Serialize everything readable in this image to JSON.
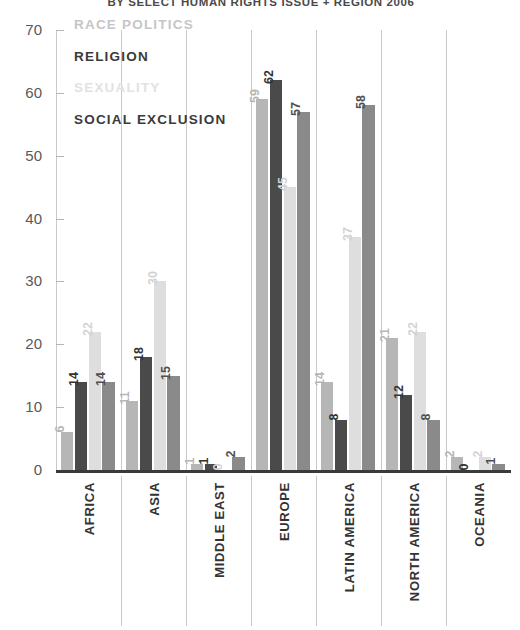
{
  "chart_data": {
    "type": "bar",
    "title": "BY SELECT HUMAN RIGHTS ISSUE + REGION 2006",
    "xlabel": "",
    "ylabel": "",
    "ylim": [
      0,
      70
    ],
    "yticks": [
      0,
      10,
      20,
      30,
      40,
      50,
      60,
      70
    ],
    "grid": false,
    "legend_position": "inside-top-left",
    "categories": [
      "AFRICA",
      "ASIA",
      "MIDDLE EAST",
      "EUROPE",
      "LATIN AMERICA",
      "NORTH AMERICA",
      "OCEANIA"
    ],
    "series": [
      {
        "name": "RACE POLITICS",
        "color": "#b6b6b6",
        "label_color": "#b6b6b6",
        "values": [
          6,
          11,
          1,
          59,
          14,
          21,
          2
        ]
      },
      {
        "name": "RELIGION",
        "color": "#4a4a4a",
        "label_color": "#333333",
        "values": [
          14,
          18,
          1,
          62,
          8,
          12,
          0
        ]
      },
      {
        "name": "SEXUALITY",
        "color": "#dedede",
        "label_color": "#d3d3d3",
        "values": [
          22,
          30,
          0,
          45,
          37,
          22,
          2
        ]
      },
      {
        "name": "SOCIAL EXCLUSION",
        "color": "#8a8a8a",
        "label_color": "#4f4f4f",
        "values": [
          14,
          15,
          2,
          57,
          58,
          8,
          1
        ]
      }
    ]
  }
}
